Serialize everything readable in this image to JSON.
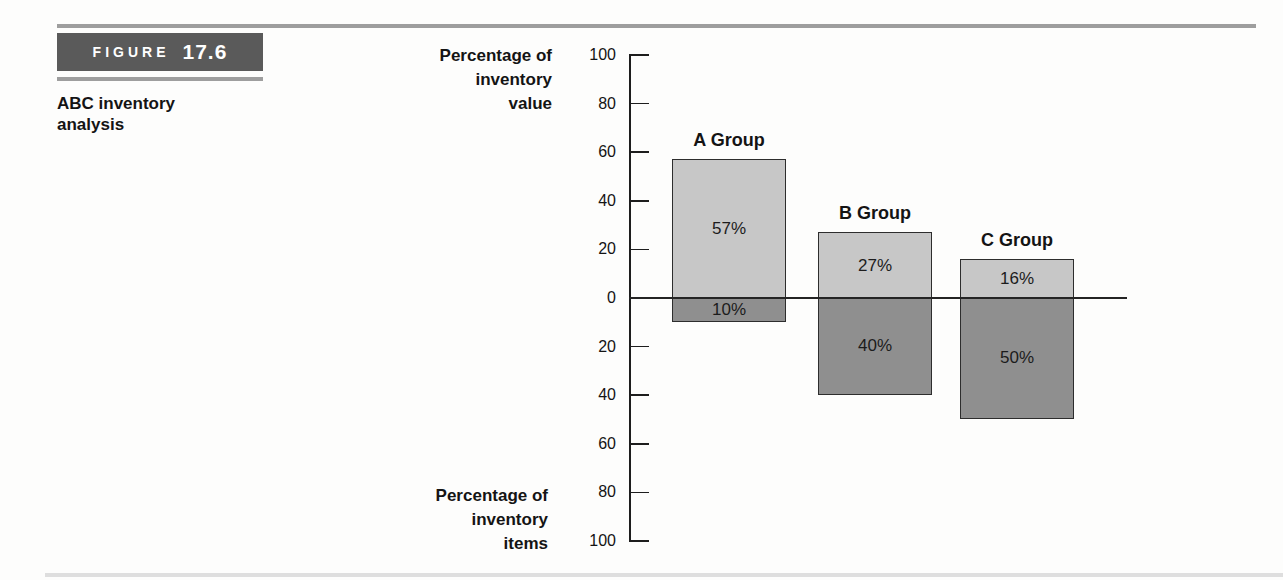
{
  "figure": {
    "tag_label": "FIGURE",
    "tag_number": "17.6",
    "caption": "ABC inventory analysis"
  },
  "axis_labels": {
    "top": [
      "Percentage of",
      "inventory",
      "value"
    ],
    "bottom": [
      "Percentage of",
      "inventory",
      "items"
    ]
  },
  "chart_data": {
    "type": "bar",
    "title": "ABC inventory analysis",
    "orientation": "vertical-mirrored",
    "categories": [
      "A Group",
      "B Group",
      "C Group"
    ],
    "series": [
      {
        "name": "Percentage of inventory value",
        "axis_side": "above",
        "values": [
          57,
          27,
          16
        ],
        "labels": [
          "57%",
          "27%",
          "16%"
        ]
      },
      {
        "name": "Percentage of inventory items",
        "axis_side": "below",
        "values": [
          10,
          40,
          50
        ],
        "labels": [
          "10%",
          "40%",
          "50%"
        ]
      }
    ],
    "y_axis": {
      "upper_label": "Percentage of inventory value",
      "lower_label": "Percentage of inventory items",
      "upper_ticks": [
        100,
        80,
        60,
        40,
        20
      ],
      "zero_tick": 0,
      "lower_ticks": [
        20,
        40,
        60,
        80,
        100
      ],
      "range_each_side": [
        0,
        100
      ],
      "tick_step": 20
    },
    "grid": false,
    "legend": "none"
  },
  "colors": {
    "bar_above": "#c7c7c7",
    "bar_below": "#8f8f8f",
    "bar_border": "#2d2d2d",
    "axis": "#1d1d1d",
    "figure_box_bg": "#5a5a5a",
    "figure_box_text": "#ffffff",
    "rule_gray": "#9e9e9e",
    "bottom_rule": "#dedede",
    "text": "#141414",
    "background": "#fdfdfc"
  }
}
